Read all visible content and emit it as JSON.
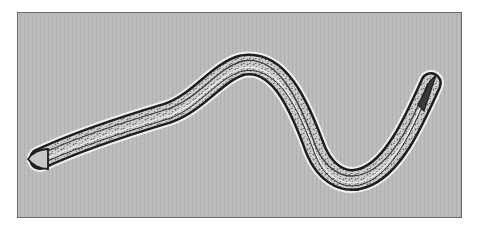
{
  "image": {
    "subject": "nematode-worm-micrograph",
    "background_color": "#b9b9b9",
    "border_color": "#6a6a6a",
    "body_outline_color": "#1e1e1e",
    "body_fill_color": "#c8c8c8",
    "highlight_color": "#f2f2f2"
  }
}
